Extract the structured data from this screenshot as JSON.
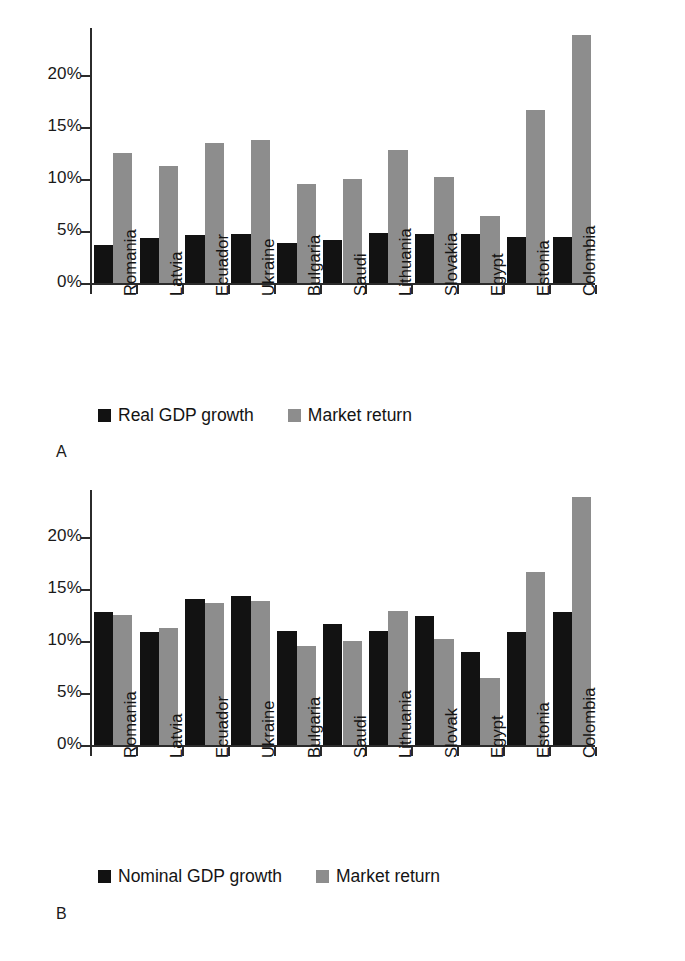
{
  "figure": {
    "panels": [
      {
        "letter": "A",
        "legend": [
          {
            "label": "Real GDP growth",
            "swatch": "dark"
          },
          {
            "label": "Market return",
            "swatch": "light"
          }
        ]
      },
      {
        "letter": "B",
        "legend": [
          {
            "label": "Nominal GDP growth",
            "swatch": "dark"
          },
          {
            "label": "Market return",
            "swatch": "light"
          }
        ]
      }
    ],
    "colors": {
      "gdp_bar": "#121212",
      "market_bar": "#8d8d8d",
      "axis": "#2b2b2b",
      "text": "#141414",
      "background": "#ffffff"
    }
  },
  "chart_data": [
    {
      "type": "bar",
      "panel": "A",
      "title": "",
      "xlabel": "",
      "ylabel": "",
      "ylim": [
        0,
        24.5
      ],
      "yticks": [
        0,
        5,
        10,
        15,
        20
      ],
      "ytick_labels": [
        "0%",
        "5%",
        "10%",
        "15%",
        "20%"
      ],
      "grid": false,
      "legend_position": "bottom",
      "categories": [
        "Romania",
        "Latvia",
        "Ecuador",
        "Ukraine",
        "Bulgaria",
        "Saudi",
        "Lithuania",
        "Slovakia",
        "Egypt",
        "Estonia",
        "Colombia"
      ],
      "series": [
        {
          "name": "Real GDP growth",
          "color": "#121212",
          "values": [
            3.7,
            4.3,
            4.6,
            4.7,
            3.8,
            4.1,
            4.8,
            4.7,
            4.7,
            4.4,
            4.4
          ]
        },
        {
          "name": "Market return",
          "color": "#8d8d8d",
          "values": [
            12.5,
            11.2,
            13.5,
            13.7,
            9.5,
            10.0,
            12.8,
            10.2,
            6.4,
            16.6,
            23.8
          ]
        }
      ]
    },
    {
      "type": "bar",
      "panel": "B",
      "title": "",
      "xlabel": "",
      "ylabel": "",
      "ylim": [
        0,
        24.5
      ],
      "yticks": [
        0,
        5,
        10,
        15,
        20
      ],
      "ytick_labels": [
        "0%",
        "5%",
        "10%",
        "15%",
        "20%"
      ],
      "grid": false,
      "legend_position": "bottom",
      "categories": [
        "Romania",
        "Latvia",
        "Ecuador",
        "Ukraine",
        "Bulgaria",
        "Saudi",
        "Lithuania",
        "Slovak",
        "Egypt",
        "Estonia",
        "Colombia"
      ],
      "series": [
        {
          "name": "Nominal GDP growth",
          "color": "#121212",
          "values": [
            12.8,
            10.9,
            14.0,
            14.3,
            11.0,
            11.6,
            11.0,
            12.4,
            8.9,
            10.9,
            12.8
          ]
        },
        {
          "name": "Market return",
          "color": "#8d8d8d",
          "values": [
            12.5,
            11.2,
            13.6,
            13.8,
            9.5,
            10.0,
            12.9,
            10.2,
            6.4,
            16.6,
            23.8
          ]
        }
      ]
    }
  ]
}
